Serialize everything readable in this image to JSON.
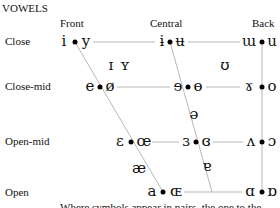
{
  "title": "VOWELS",
  "columns": [
    {
      "label": "Front",
      "x": 70
    },
    {
      "label": "Central",
      "x": 150
    },
    {
      "label": "Back",
      "x": 252
    }
  ],
  "rows": [
    {
      "label": "Close",
      "y": 42
    },
    {
      "label": "Close-mid",
      "y": 87
    },
    {
      "label": "Open-mid",
      "y": 142
    },
    {
      "label": "Open",
      "y": 192
    }
  ],
  "pairs": [
    {
      "unrounded": "i",
      "rounded": "y",
      "ux": 64,
      "dotx": 75,
      "rx": 86,
      "y": 42
    },
    {
      "unrounded": "ɨ",
      "rounded": "ʉ",
      "ux": 162,
      "dotx": 170,
      "rx": 180,
      "y": 42
    },
    {
      "unrounded": "ɯ",
      "rounded": "u",
      "ux": 248,
      "dotx": 262,
      "rx": 272,
      "y": 42
    },
    {
      "unrounded": "e",
      "rounded": "ø",
      "ux": 90,
      "dotx": 100,
      "rx": 110,
      "y": 87
    },
    {
      "unrounded": "ɘ",
      "rounded": "ɵ",
      "ux": 178,
      "dotx": 188,
      "rx": 198,
      "y": 87
    },
    {
      "unrounded": "ɤ",
      "rounded": "o",
      "ux": 248,
      "dotx": 262,
      "rx": 272,
      "y": 87
    },
    {
      "unrounded": "ɛ",
      "rounded": "œ",
      "ux": 120,
      "dotx": 131,
      "rx": 144,
      "y": 142
    },
    {
      "unrounded": "ɜ",
      "rounded": "ɞ",
      "ux": 186,
      "dotx": 196,
      "rx": 206,
      "y": 142
    },
    {
      "unrounded": "ʌ",
      "rounded": "ɔ",
      "ux": 250,
      "dotx": 262,
      "rx": 272,
      "y": 142
    },
    {
      "unrounded": "a",
      "rounded": "ɶ",
      "ux": 152,
      "dotx": 163,
      "rx": 176,
      "y": 192
    },
    {
      "unrounded": "ɑ",
      "rounded": "ɒ",
      "ux": 249,
      "dotx": 262,
      "rx": 272,
      "y": 192
    }
  ],
  "singles": [
    {
      "symbol": "ɪ",
      "x": 111,
      "y": 66
    },
    {
      "symbol": "ʏ",
      "x": 125,
      "y": 66
    },
    {
      "symbol": "ʊ",
      "x": 225,
      "y": 66
    },
    {
      "symbol": "ə",
      "x": 194,
      "y": 115
    },
    {
      "symbol": "æ",
      "x": 139,
      "y": 169
    },
    {
      "symbol": "ɐ",
      "x": 207,
      "y": 167
    }
  ],
  "note": "Where symbols appear in pairs, the one to the right represents a rounded vowel.",
  "colors": {
    "line": "#b8b8b8",
    "text": "#111111",
    "dot": "#000000"
  }
}
